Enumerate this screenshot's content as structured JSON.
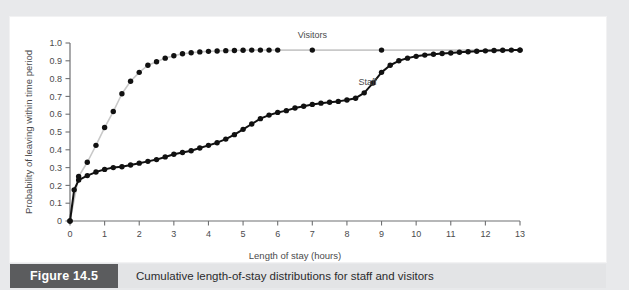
{
  "figure": {
    "tag_label": "Figure 14.5",
    "caption": "Cumulative length-of-stay distributions for staff and visitors",
    "tag_background": "#5b5c5e",
    "caption_background": "#e3e4e6",
    "page_background": "#e8e9eb",
    "panel_background": "#ffffff"
  },
  "chart_data": {
    "type": "line",
    "title": "",
    "subtitle": "",
    "xlabel": "Length of stay (hours)",
    "ylabel": "Probability of leaving within time period",
    "xlim": [
      0,
      13
    ],
    "ylim": [
      0,
      1.0
    ],
    "xticks": [
      0,
      1,
      2,
      3,
      4,
      5,
      6,
      7,
      8,
      9,
      10,
      11,
      12,
      13
    ],
    "xtick_labels": [
      "0",
      "1",
      "2",
      "3",
      "4",
      "5",
      "6",
      "7",
      "8",
      "9",
      "10",
      "11",
      "12",
      "13"
    ],
    "yticks": [
      0,
      0.1,
      0.2,
      0.3,
      0.4,
      0.5,
      0.6,
      0.7,
      0.8,
      0.9,
      1.0
    ],
    "ytick_labels": [
      "0",
      "0.1",
      "0.2",
      "0.3",
      "0.4",
      "0.5",
      "0.6",
      "0.7",
      "0.8",
      "0.9",
      "1.0"
    ],
    "grid": false,
    "legend_position": "inline-annotation",
    "annotations": [
      {
        "text": "Visitors",
        "x": 7.0,
        "y": 1.0
      },
      {
        "text": "Staff",
        "x": 8.6,
        "y": 0.735
      }
    ],
    "series": [
      {
        "name": "Visitors",
        "line_color": "#c9c9c9",
        "marker_color": "#111111",
        "marker": "circle",
        "x": [
          0,
          0.25,
          0.5,
          0.75,
          1.0,
          1.25,
          1.5,
          1.75,
          2.0,
          2.25,
          2.5,
          2.75,
          3.0,
          3.25,
          3.5,
          3.75,
          4.0,
          4.25,
          4.5,
          4.75,
          5.0,
          5.25,
          5.5,
          5.75,
          6.0,
          7.0,
          9.0,
          13.0
        ],
        "values": [
          0,
          0.25,
          0.33,
          0.425,
          0.525,
          0.615,
          0.715,
          0.785,
          0.835,
          0.875,
          0.895,
          0.915,
          0.928,
          0.94,
          0.945,
          0.95,
          0.953,
          0.955,
          0.957,
          0.958,
          0.959,
          0.96,
          0.96,
          0.96,
          0.96,
          0.96,
          0.96,
          0.96
        ]
      },
      {
        "name": "Staff",
        "line_color": "#111111",
        "marker_color": "#111111",
        "marker": "circle",
        "x": [
          0,
          0.12,
          0.25,
          0.5,
          0.75,
          1.0,
          1.25,
          1.5,
          1.75,
          2.0,
          2.25,
          2.5,
          2.75,
          3.0,
          3.25,
          3.5,
          3.75,
          4.0,
          4.25,
          4.5,
          4.75,
          5.0,
          5.25,
          5.5,
          5.75,
          6.0,
          6.25,
          6.5,
          6.75,
          7.0,
          7.25,
          7.5,
          7.75,
          8.0,
          8.25,
          8.5,
          8.75,
          9.0,
          9.25,
          9.5,
          9.75,
          10.0,
          10.25,
          10.5,
          10.75,
          11.0,
          11.25,
          11.5,
          11.75,
          12.0,
          12.25,
          12.5,
          12.75,
          13.0
        ],
        "values": [
          0,
          0.175,
          0.23,
          0.255,
          0.275,
          0.29,
          0.3,
          0.305,
          0.315,
          0.325,
          0.335,
          0.345,
          0.36,
          0.375,
          0.385,
          0.395,
          0.41,
          0.425,
          0.44,
          0.46,
          0.485,
          0.515,
          0.545,
          0.575,
          0.595,
          0.61,
          0.62,
          0.635,
          0.645,
          0.655,
          0.662,
          0.667,
          0.672,
          0.68,
          0.69,
          0.72,
          0.775,
          0.835,
          0.875,
          0.9,
          0.915,
          0.925,
          0.932,
          0.937,
          0.941,
          0.944,
          0.948,
          0.951,
          0.954,
          0.956,
          0.958,
          0.959,
          0.96,
          0.96
        ]
      }
    ]
  }
}
